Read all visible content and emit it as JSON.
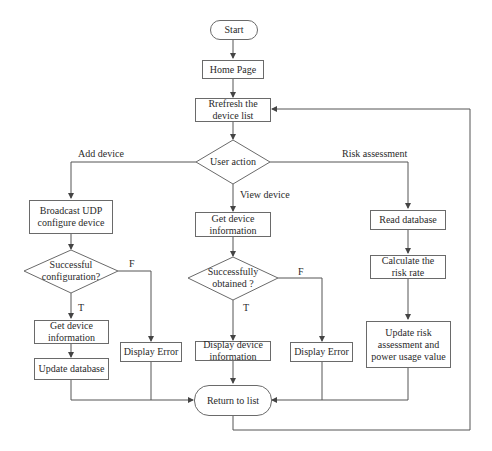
{
  "diagram": {
    "type": "flowchart",
    "nodes": {
      "start": "Start",
      "home_page": "Home Page",
      "refresh_list": "Rrefresh the\ndevice list",
      "user_action": "User action",
      "broadcast_udp": "Broadcast UDP\nconfigure device",
      "successful_configuration": "Successful\nconfiguration?",
      "get_device_info_left": "Get device\ninformation",
      "update_database": "Update database",
      "display_error_left": "Display Error",
      "get_device_info_mid": "Get device\ninformation",
      "successfully_obtained": "Successfully\nobtained ?",
      "display_device_info": "Display device\ninformation",
      "display_error_mid": "Display Error",
      "read_database": "Read database",
      "calculate_risk_rate": "Calculate the\nrisk rate",
      "update_risk": "Update risk\nassessment and\npower usage value",
      "return_to_list": "Return to list"
    },
    "edge_labels": {
      "add_device": "Add device",
      "view_device": "View device",
      "risk_assessment": "Risk assessment",
      "left_true": "T",
      "left_false": "F",
      "mid_true": "T",
      "mid_false": "F"
    },
    "colors": {
      "line": "#555555",
      "border": "#6a6a6a",
      "text": "#2a2a2a",
      "background": "#ffffff"
    }
  }
}
